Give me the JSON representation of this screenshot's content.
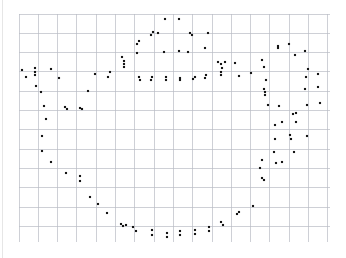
{
  "figure": {
    "title": "",
    "background_color": "#ffffff",
    "grid_color": "#b9bcc4",
    "dot_color": "#161616",
    "margin_rule_color": "#e6e6e6"
  },
  "chart_data": {
    "type": "scatter",
    "title": "",
    "subtitle": "",
    "xlabel": "",
    "ylabel": "",
    "xlim": [
      19,
      330
    ],
    "ylim": [
      14,
      242
    ],
    "grid": true,
    "grid_spacing_px": 19.3,
    "grid_x_start": 19,
    "grid_x_end": 330,
    "grid_y_start": 14,
    "grid_y_end": 242,
    "legend": null,
    "annotations": [],
    "series": [
      {
        "name": "outline-points",
        "marker": "square",
        "marker_size_px": 2.1,
        "color": "#161616",
        "points": [
          [
            22,
            70
          ],
          [
            26,
            77
          ],
          [
            35,
            68
          ],
          [
            35,
            72
          ],
          [
            35,
            75
          ],
          [
            36,
            86
          ],
          [
            41,
            92
          ],
          [
            51,
            69
          ],
          [
            59,
            78
          ],
          [
            44,
            106
          ],
          [
            65,
            107
          ],
          [
            67,
            109
          ],
          [
            80,
            108
          ],
          [
            82,
            109
          ],
          [
            88,
            91
          ],
          [
            46,
            119
          ],
          [
            42,
            136
          ],
          [
            42,
            151
          ],
          [
            51,
            162
          ],
          [
            66,
            173
          ],
          [
            80,
            176
          ],
          [
            80,
            181
          ],
          [
            90,
            197
          ],
          [
            98,
            204
          ],
          [
            107,
            213
          ],
          [
            121,
            224
          ],
          [
            123,
            226
          ],
          [
            126,
            225
          ],
          [
            133,
            227
          ],
          [
            136,
            231
          ],
          [
            152,
            230
          ],
          [
            152,
            235
          ],
          [
            167,
            233
          ],
          [
            167,
            237
          ],
          [
            180,
            231
          ],
          [
            180,
            235
          ],
          [
            195,
            230
          ],
          [
            195,
            234
          ],
          [
            209,
            227
          ],
          [
            209,
            231
          ],
          [
            221,
            222
          ],
          [
            223,
            225
          ],
          [
            237,
            214
          ],
          [
            239,
            212
          ],
          [
            253,
            206
          ],
          [
            95,
            74
          ],
          [
            108,
            77
          ],
          [
            110,
            72
          ],
          [
            124,
            61
          ],
          [
            122,
            57
          ],
          [
            137,
            44
          ],
          [
            139,
            41
          ],
          [
            151,
            35
          ],
          [
            153,
            32
          ],
          [
            158,
            33
          ],
          [
            165,
            19
          ],
          [
            179,
            19
          ],
          [
            190,
            33
          ],
          [
            192,
            35
          ],
          [
            205,
            48
          ],
          [
            208,
            33
          ],
          [
            124,
            64
          ],
          [
            124,
            67
          ],
          [
            137,
            53
          ],
          [
            139,
            77
          ],
          [
            140,
            80
          ],
          [
            151,
            80
          ],
          [
            152,
            77
          ],
          [
            164,
            52
          ],
          [
            166,
            80
          ],
          [
            166,
            77
          ],
          [
            179,
            51
          ],
          [
            180,
            80
          ],
          [
            180,
            78
          ],
          [
            188,
            52
          ],
          [
            193,
            79
          ],
          [
            195,
            77
          ],
          [
            205,
            78
          ],
          [
            206,
            75
          ],
          [
            218,
            62
          ],
          [
            221,
            64
          ],
          [
            222,
            68
          ],
          [
            225,
            62
          ],
          [
            221,
            72
          ],
          [
            221,
            75
          ],
          [
            235,
            63
          ],
          [
            239,
            76
          ],
          [
            251,
            73
          ],
          [
            262,
            60
          ],
          [
            264,
            67
          ],
          [
            266,
            80
          ],
          [
            278,
            48
          ],
          [
            264,
            89
          ],
          [
            265,
            92
          ],
          [
            265,
            95
          ],
          [
            268,
            105
          ],
          [
            279,
            106
          ],
          [
            282,
            122
          ],
          [
            293,
            114
          ],
          [
            296,
            113
          ],
          [
            290,
            135
          ],
          [
            291,
            139
          ],
          [
            275,
            125
          ],
          [
            275,
            139
          ],
          [
            274,
            152
          ],
          [
            276,
            163
          ],
          [
            262,
            160
          ],
          [
            260,
            168
          ],
          [
            262,
            178
          ],
          [
            264,
            180
          ],
          [
            278,
            46
          ],
          [
            289,
            44
          ],
          [
            295,
            55
          ],
          [
            305,
            51
          ],
          [
            308,
            69
          ],
          [
            306,
            77
          ],
          [
            318,
            74
          ],
          [
            305,
            89
          ],
          [
            318,
            87
          ],
          [
            307,
            105
          ],
          [
            320,
            103
          ],
          [
            296,
            122
          ],
          [
            307,
            136
          ],
          [
            294,
            152
          ],
          [
            282,
            162
          ]
        ]
      }
    ]
  }
}
